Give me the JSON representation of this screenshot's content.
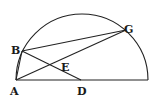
{
  "diagram": {
    "type": "geometry",
    "points": {
      "A": {
        "label": "A",
        "x": 16,
        "y": 80
      },
      "B": {
        "label": "B",
        "x": 22,
        "y": 51
      },
      "G": {
        "label": "G",
        "x": 126,
        "y": 30
      },
      "D": {
        "label": "D",
        "x": 81,
        "y": 80
      },
      "E": {
        "label": "E",
        "x": 58,
        "y": 62
      },
      "R": {
        "x": 148,
        "y": 80
      }
    },
    "segments": [
      [
        "A",
        "R"
      ],
      [
        "B",
        "G"
      ],
      [
        "A",
        "G"
      ],
      [
        "B",
        "D"
      ]
    ],
    "arc": {
      "center": [
        82,
        80
      ],
      "radius": 66,
      "from": "A",
      "to": "R"
    },
    "labels": {
      "A": "A",
      "B": "B",
      "G": "G",
      "D": "D",
      "E": "E"
    }
  }
}
